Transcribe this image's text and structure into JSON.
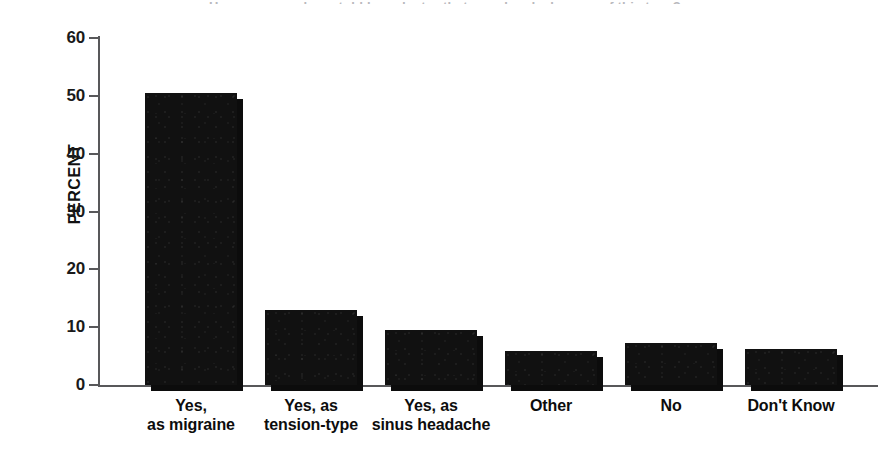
{
  "figure": {
    "cut_off_title_sliver": "Have you ever been told by a doctor that your headaches are of this type?",
    "y_axis_title": "PERCENT"
  },
  "chart_data": {
    "type": "bar",
    "title": "",
    "xlabel": "",
    "ylabel": "PERCENT",
    "ylim": [
      0,
      60
    ],
    "yticks": [
      0,
      10,
      20,
      30,
      40,
      50,
      60
    ],
    "ytick_labels": [
      "0",
      "10",
      "20",
      "30",
      "40",
      "50",
      "60"
    ],
    "grid": false,
    "legend": false,
    "bar_color": "#111111",
    "categories": [
      "Yes,\nas migraine",
      "Yes, as\ntension-type",
      "Yes, as\nsinus headache",
      "Other",
      "No",
      "Don't Know"
    ],
    "category_lines": [
      [
        "Yes,",
        "as migraine"
      ],
      [
        "Yes, as",
        "tension-type"
      ],
      [
        "Yes, as",
        "sinus headache"
      ],
      [
        "Other",
        ""
      ],
      [
        "No",
        ""
      ],
      [
        "Don't Know",
        ""
      ]
    ],
    "values": [
      50.5,
      13.0,
      9.5,
      5.8,
      7.3,
      6.2
    ]
  }
}
